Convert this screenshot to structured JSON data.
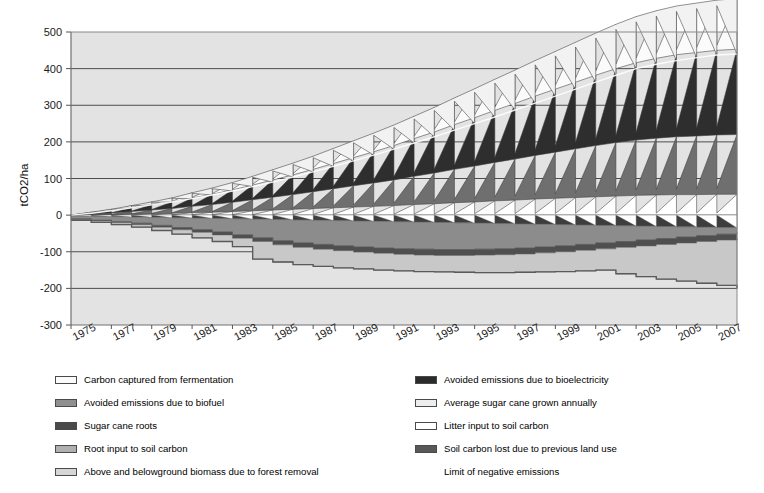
{
  "chart_data": {
    "type": "area",
    "title": "",
    "subtitle": "",
    "xlabel": "",
    "ylabel": "tCO2/ha",
    "ylim": [
      -300,
      500
    ],
    "yticks": [
      500,
      400,
      300,
      200,
      100,
      0,
      -100,
      -200,
      -300
    ],
    "ytick_labels": [
      "500",
      "400",
      "300",
      "200",
      "100",
      "0",
      "-100",
      "-200",
      "-300"
    ],
    "xlim": [
      1975,
      2008
    ],
    "xticks": [
      1975,
      1977,
      1979,
      1981,
      1983,
      1985,
      1987,
      1989,
      1991,
      1993,
      1995,
      1997,
      1999,
      2001,
      2003,
      2005,
      2007
    ],
    "xtick_labels": [
      "1975",
      "1977",
      "1979",
      "1981",
      "1983",
      "1985",
      "1987",
      "1989",
      "1991",
      "1993",
      "1995",
      "1997",
      "1999",
      "2001",
      "2003",
      "2005",
      "2007"
    ],
    "grid": true,
    "grid_axis": "y",
    "legend_position": "below-two-columns",
    "stacking": "stacked-area-with-annual-sawtooth",
    "plot_background": "#e3e3e3",
    "years": [
      1975,
      1976,
      1977,
      1978,
      1979,
      1980,
      1981,
      1982,
      1983,
      1984,
      1985,
      1986,
      1987,
      1988,
      1989,
      1990,
      1991,
      1992,
      1993,
      1994,
      1995,
      1996,
      1997,
      1998,
      1999,
      2000,
      2001,
      2002,
      2003,
      2004,
      2005,
      2006,
      2007,
      2008
    ],
    "series": [
      {
        "name": "Average sugar cane grown annually",
        "color": "#f2f2f2",
        "kind": "sawtooth-cumulative-top",
        "values": [
          0,
          5,
          12,
          20,
          28,
          36,
          45,
          55,
          66,
          78,
          90,
          104,
          118,
          133,
          148,
          164,
          180,
          197,
          214,
          232,
          250,
          268,
          287,
          306,
          325,
          344,
          363,
          382,
          400,
          412,
          422,
          430,
          437,
          440
        ]
      },
      {
        "name": "Carbon captured from fermentation",
        "color": "#fbfbfb",
        "kind": "sawtooth-band",
        "values": [
          0,
          2,
          4,
          6,
          8,
          11,
          14,
          17,
          20,
          24,
          28,
          32,
          36,
          41,
          46,
          51,
          56,
          61,
          67,
          73,
          79,
          85,
          91,
          97,
          103,
          109,
          115,
          121,
          126,
          130,
          133,
          135,
          137,
          138
        ]
      },
      {
        "name": "Avoided emissions due to bioelectricity",
        "color": "#2e2e2e",
        "kind": "sawtooth-band",
        "values": [
          0,
          3,
          6,
          10,
          14,
          18,
          23,
          28,
          34,
          40,
          47,
          54,
          61,
          69,
          77,
          85,
          94,
          103,
          112,
          122,
          132,
          142,
          152,
          162,
          172,
          182,
          192,
          202,
          211,
          218,
          224,
          228,
          231,
          233
        ]
      },
      {
        "name": "Avoided emissions due to biofuel",
        "color": "#6f6f6f",
        "kind": "sawtooth-band",
        "values": [
          0,
          2,
          4,
          7,
          10,
          13,
          17,
          21,
          25,
          30,
          35,
          40,
          46,
          52,
          58,
          64,
          70,
          77,
          84,
          91,
          98,
          105,
          112,
          119,
          126,
          133,
          140,
          146,
          151,
          155,
          158,
          160,
          162,
          163
        ]
      },
      {
        "name": "Litter input to soil carbon",
        "color": "#ffffff",
        "kind": "sawtooth-band-lower",
        "values": [
          0,
          1,
          2,
          3,
          4,
          5,
          7,
          8,
          10,
          12,
          14,
          16,
          18,
          20,
          22,
          24,
          26,
          29,
          31,
          34,
          36,
          39,
          41,
          44,
          46,
          48,
          50,
          52,
          54,
          55,
          56,
          56,
          57,
          57
        ]
      },
      {
        "name": "Sugar cane roots",
        "color": "#3d3d3d",
        "kind": "band-lower",
        "values": [
          -2,
          -3,
          -4,
          -5,
          -6,
          -7,
          -8,
          -9,
          -10,
          -11,
          -12,
          -13,
          -14,
          -15,
          -16,
          -17,
          -18,
          -19,
          -20,
          -21,
          -22,
          -23,
          -24,
          -25,
          -26,
          -27,
          -28,
          -29,
          -30,
          -31,
          -32,
          -33,
          -34,
          -35
        ]
      },
      {
        "name": "Root input to soil carbon",
        "color": "#8c8c8c",
        "kind": "band-lower",
        "values": [
          -10,
          -14,
          -18,
          -22,
          -28,
          -34,
          -40,
          -46,
          -54,
          -62,
          -70,
          -76,
          -80,
          -84,
          -87,
          -90,
          -92,
          -93,
          -94,
          -94,
          -93,
          -92,
          -90,
          -87,
          -84,
          -80,
          -76,
          -72,
          -68,
          -64,
          -60,
          -56,
          -52,
          -48
        ]
      },
      {
        "name": "Soil carbon lost due to previous land use",
        "color": "#4f4f4f",
        "kind": "band-lower",
        "values": [
          -12,
          -16,
          -21,
          -26,
          -33,
          -40,
          -47,
          -54,
          -63,
          -72,
          -81,
          -88,
          -93,
          -97,
          -101,
          -104,
          -107,
          -109,
          -110,
          -110,
          -109,
          -108,
          -106,
          -103,
          -100,
          -96,
          -92,
          -88,
          -84,
          -80,
          -76,
          -72,
          -68,
          -64
        ]
      },
      {
        "name": "Above and belowground biomass due to forest removal",
        "color": "#c8c8c8",
        "kind": "band-lower",
        "values": [
          -14,
          -20,
          -26,
          -33,
          -42,
          -52,
          -62,
          -72,
          -86,
          -120,
          -128,
          -135,
          -140,
          -144,
          -147,
          -150,
          -152,
          -154,
          -155,
          -156,
          -157,
          -157,
          -156,
          -155,
          -154,
          -152,
          -150,
          -160,
          -168,
          -175,
          -180,
          -186,
          -192,
          -200
        ]
      }
    ],
    "negative_limit_line": {
      "name": "Limit of negative emissions",
      "color": "#5a5a5a",
      "values": [
        -14,
        -20,
        -26,
        -33,
        -42,
        -52,
        -62,
        -72,
        -86,
        -120,
        -128,
        -135,
        -140,
        -144,
        -147,
        -150,
        -152,
        -154,
        -155,
        -156,
        -157,
        -157,
        -156,
        -155,
        -154,
        -152,
        -150,
        -160,
        -168,
        -175,
        -180,
        -186,
        -192,
        -200
      ]
    }
  },
  "legend": {
    "left_column": [
      {
        "label": "Carbon captured from fermentation",
        "swatch": "#fbfbfb"
      },
      {
        "label": "Avoided emissions due to biofuel",
        "swatch": "#8f8f8f"
      },
      {
        "label": "Sugar cane roots",
        "swatch": "#4a4a4a"
      },
      {
        "label": "Root input to soil carbon",
        "swatch": "#b0b0b0"
      },
      {
        "label": "Above and belowground biomass due to forest removal",
        "swatch": "#d6d6d6"
      }
    ],
    "right_column": [
      {
        "label": "Avoided emissions due to bioelectricity",
        "swatch": "#2b2b2b"
      },
      {
        "label": "Average sugar cane grown annually",
        "swatch": "#ededed"
      },
      {
        "label": "Litter input to soil carbon",
        "swatch": "#ffffff"
      },
      {
        "label": "Soil carbon lost due to previous land use",
        "swatch": "#585858"
      },
      {
        "label": "Limit of negative emissions",
        "swatch": "none"
      }
    ]
  }
}
